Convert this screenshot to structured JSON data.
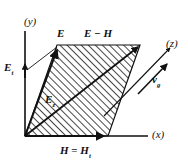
{
  "figure": {
    "type": "vector-diagram",
    "background_color": "#ffffff",
    "line_color": "#111111",
    "hatch_color": "#1a1a1a"
  },
  "axes": [
    {
      "id": "y",
      "label": "(y)",
      "direction": "up"
    },
    {
      "id": "x",
      "label": "(x)",
      "direction": "right"
    },
    {
      "id": "z",
      "label": "(z)",
      "direction": "up-right"
    }
  ],
  "labels": {
    "E": "E",
    "E_minus_H": "E − H",
    "E_t": {
      "base": "E",
      "sub": "t"
    },
    "E_z": {
      "base": "E",
      "sub": "z"
    },
    "H_eq_H_t": {
      "base": "H",
      "op": " = ",
      "base2": "H",
      "sub": "t"
    },
    "v_g": {
      "base": "v",
      "sub": "g"
    }
  },
  "label_text": {
    "E": "E",
    "E_minus_H": "E − H",
    "E_t_base": "E",
    "E_t_sub": "t",
    "E_z_base": "E",
    "E_z_sub": "z",
    "H_base": "H",
    "H_op": " = ",
    "H_base2": "H",
    "H_sub": "t",
    "vg_base": "v",
    "vg_sub": "g",
    "axis_y": "(y)",
    "axis_x": "(x)",
    "axis_z": "(z)"
  },
  "geometry": {
    "origin": [
      25,
      136
    ],
    "parallelogram": [
      [
        25,
        136
      ],
      [
        57,
        45
      ],
      [
        140,
        45
      ],
      [
        108,
        136
      ]
    ],
    "vector_E": {
      "from": [
        25,
        136
      ],
      "to": [
        57,
        46
      ]
    },
    "vector_H": {
      "from": [
        25,
        136
      ],
      "to": [
        106,
        136
      ]
    },
    "vector_Ez_diagonal": {
      "from": [
        25,
        136
      ],
      "to": [
        140,
        45
      ]
    },
    "z_axis_arrow": {
      "from": [
        108,
        112
      ],
      "to": [
        172,
        47
      ]
    },
    "vg_arrow": {
      "from": [
        140,
        93
      ],
      "to": [
        168,
        64
      ]
    },
    "Et_leader": {
      "from": [
        57,
        47
      ],
      "to": [
        25,
        70
      ]
    }
  }
}
